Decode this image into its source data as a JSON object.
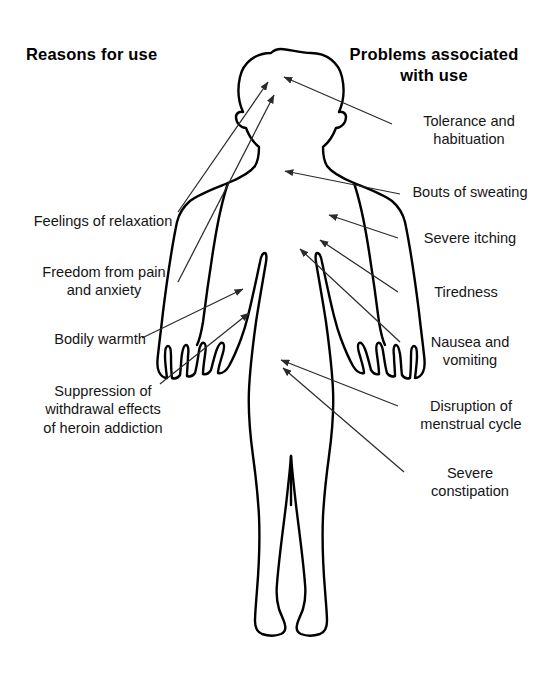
{
  "diagram": {
    "background_color": "#ffffff",
    "line_color": "#000000",
    "arrow_color": "#2b2b2b",
    "headings": {
      "left": "Reasons for use",
      "right": "Problems associated\nwith use",
      "right_line1": "Problems associated",
      "right_line2": "with use"
    },
    "reasons_for_use": [
      {
        "id": "feelings-of-relaxation",
        "text": "Feelings of relaxation",
        "lines": [
          "Feelings of relaxation"
        ],
        "target": "head"
      },
      {
        "id": "freedom-from-pain-and-anxiety",
        "text": "Freedom from pain and anxiety",
        "lines": [
          "Freedom from pain",
          "and anxiety"
        ],
        "target": "head"
      },
      {
        "id": "bodily-warmth",
        "text": "Bodily warmth",
        "lines": [
          "Bodily warmth"
        ],
        "target": "torso"
      },
      {
        "id": "suppression-of-withdrawal-effects",
        "text": "Suppression of withdrawal effects of heroin addiction",
        "lines": [
          "Suppression of",
          "withdrawal effects",
          "of heroin addiction"
        ],
        "target": "abdomen"
      }
    ],
    "problems_with_use": [
      {
        "id": "tolerance-and-habituation",
        "text": "Tolerance and habituation",
        "lines": [
          "Tolerance and",
          "habituation"
        ],
        "target": "head"
      },
      {
        "id": "bouts-of-sweating",
        "text": "Bouts of sweating",
        "lines": [
          "Bouts of sweating"
        ],
        "target": "shoulder"
      },
      {
        "id": "severe-itching",
        "text": "Severe itching",
        "lines": [
          "Severe itching"
        ],
        "target": "chest"
      },
      {
        "id": "tiredness",
        "text": "Tiredness",
        "lines": [
          "Tiredness"
        ],
        "target": "upper-arm"
      },
      {
        "id": "nausea-and-vomiting",
        "text": "Nausea and vomiting",
        "lines": [
          "Nausea and",
          "vomiting"
        ],
        "target": "forearm"
      },
      {
        "id": "disruption-of-menstrual-cycle",
        "text": "Disruption of menstrual cycle",
        "lines": [
          "Disruption of",
          "menstrual cycle"
        ],
        "target": "pelvis"
      },
      {
        "id": "severe-constipation",
        "text": "Severe constipation",
        "lines": [
          "Severe",
          "constipation"
        ],
        "target": "pelvis"
      }
    ]
  }
}
